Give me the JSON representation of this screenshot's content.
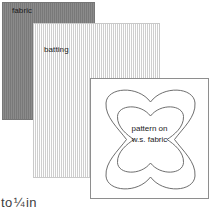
{
  "diagram": {
    "canvas": {
      "width": 214,
      "height": 218,
      "background": "#ffffff"
    },
    "layers": [
      {
        "id": "fabric",
        "label": "fabric",
        "color": "#7e7e7e",
        "texture": "vertical-stripes"
      },
      {
        "id": "batting",
        "label": "batting",
        "color": "#ededed",
        "texture": "vertical-stripes"
      },
      {
        "id": "pattern",
        "label": "",
        "color": "#ffffff",
        "texture": "plain",
        "border_color": "#8e8e8e"
      }
    ],
    "pattern": {
      "shape_name": "quatrefoil-outline",
      "outline_color": "#5d5d5d",
      "caption_line_1": "pattern on",
      "caption_line_2": "w.s. fabric"
    },
    "measure_note": {
      "prefix": "to",
      "fraction": "¼",
      "unit": "in"
    }
  }
}
